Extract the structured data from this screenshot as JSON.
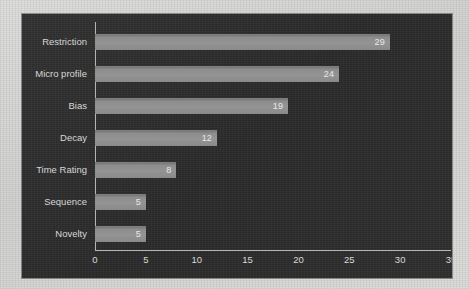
{
  "chart_data": {
    "type": "bar",
    "orientation": "horizontal",
    "title": "",
    "subtitle": "",
    "xlabel": "",
    "ylabel": "",
    "categories": [
      "Restriction",
      "Micro profile",
      "Bias",
      "Decay",
      "Time Rating",
      "Sequence",
      "Novelty"
    ],
    "values": [
      29,
      24,
      19,
      12,
      8,
      5,
      5
    ],
    "value_labels": [
      "29",
      "24",
      "19",
      "12",
      "8",
      "5",
      "5"
    ],
    "xlim": [
      0,
      35
    ],
    "xticks": [
      0,
      5,
      10,
      15,
      20,
      25,
      30,
      35
    ],
    "xtick_labels": [
      "0",
      "5",
      "10",
      "15",
      "20",
      "25",
      "30",
      "35"
    ],
    "grid": false,
    "legend": null,
    "annotations": []
  },
  "style": {
    "panel_background": "#2e2e2e",
    "page_background": "#d5d5d3",
    "bar_color": "#8d8d8d",
    "axis_color": "#b4b4b4",
    "label_color": "#d7d7d7",
    "value_label_color": "#e9e9e9"
  }
}
